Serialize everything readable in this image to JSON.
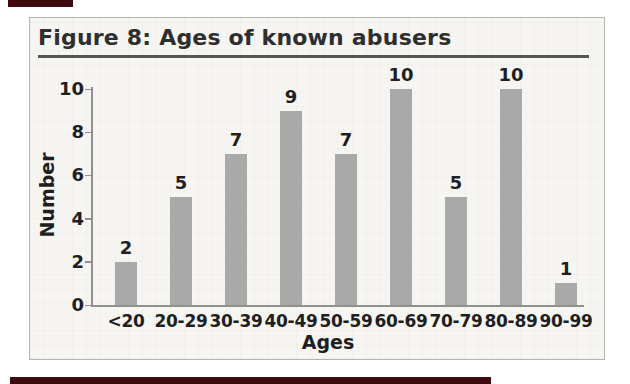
{
  "page": {
    "background": "#ffffff",
    "decoration_color": "#3f0a0e"
  },
  "figure": {
    "title": "Figure 8: Ages of known abusers",
    "title_color": "#2e2e2e",
    "rule_color": "#555555",
    "panel_border_color": "#b5b5b5",
    "panel_background": "#f6f5f2"
  },
  "chart_data": {
    "type": "bar",
    "title": "Figure 8: Ages of known abusers",
    "categories": [
      "<20",
      "20-29",
      "30-39",
      "40-49",
      "50-59",
      "60-69",
      "70-79",
      "80-89",
      "90-99"
    ],
    "values": [
      2,
      5,
      7,
      9,
      7,
      10,
      5,
      10,
      1
    ],
    "xlabel": "Ages",
    "ylabel": "Number",
    "ylim": [
      0,
      10
    ],
    "yticks": [
      0,
      2,
      4,
      6,
      8,
      10
    ],
    "bar_color": "#a9a9a9",
    "axis_color": "#909090",
    "label_color": "#1f1f1f",
    "grid": false,
    "legend": null,
    "data_labels": true
  }
}
